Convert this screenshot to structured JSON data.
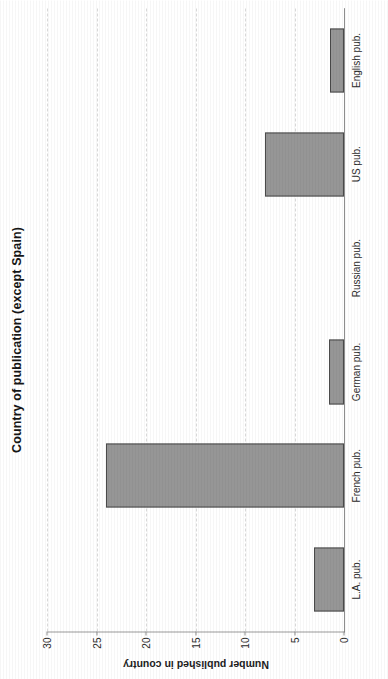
{
  "document": {
    "kind": "scanned-figure",
    "orientation": "rotated-90-ccw"
  },
  "chart_data": {
    "type": "bar",
    "title": "Country of publication (except Spain)",
    "xlabel": "",
    "ylabel": "Number published in country",
    "categories": [
      "L.A. pub.",
      "French pub.",
      "German pub.",
      "Russian pub.",
      "US pub.",
      "English pub."
    ],
    "values": [
      3,
      24,
      1.5,
      0,
      8,
      1.4
    ],
    "ylim": [
      0,
      30
    ],
    "yticks": [
      0,
      5,
      10,
      15,
      20,
      25,
      30
    ],
    "ytick_labels": [
      "0",
      "5",
      "10",
      "15",
      "20",
      "25",
      "30"
    ],
    "grid": true,
    "legend": false,
    "legend_position": "none",
    "bar_color": "#969696",
    "bar_edge_color": "#4a4a4a",
    "gridline_color": "#d8d8d8",
    "axis_color": "#8e8e8e"
  }
}
